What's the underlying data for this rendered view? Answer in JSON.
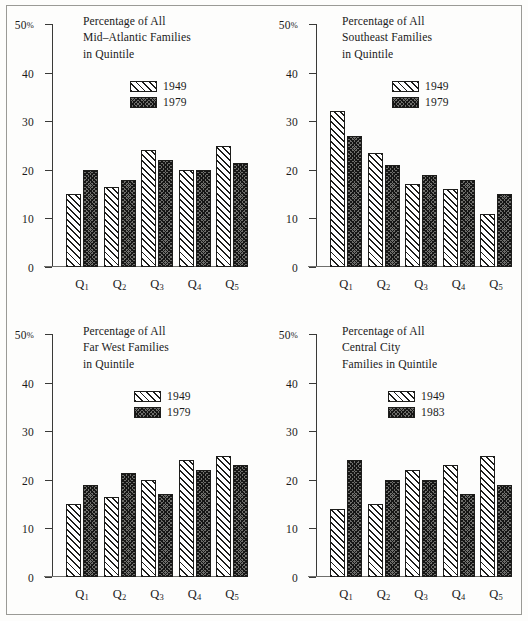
{
  "figure": {
    "axis": {
      "y_ticks": [
        {
          "value": 50,
          "label": "50",
          "suffix": "%"
        },
        {
          "value": 40,
          "label": "40",
          "suffix": ""
        },
        {
          "value": 30,
          "label": "30",
          "suffix": ""
        },
        {
          "value": 20,
          "label": "20",
          "suffix": ""
        },
        {
          "value": 10,
          "label": "10",
          "suffix": ""
        },
        {
          "value": 0,
          "label": "0",
          "suffix": ""
        }
      ],
      "y_min": 0,
      "y_max": 50
    }
  },
  "chart_data": [
    {
      "id": "mid-atlantic",
      "type": "bar",
      "title": "Percentage of All\nMid–Atlantic Families\nin Quintile",
      "xlabel": "",
      "ylabel": "",
      "ylim": [
        0,
        50
      ],
      "grid": false,
      "legend_position": "top-right",
      "categories": [
        "Q1",
        "Q2",
        "Q3",
        "Q4",
        "Q5"
      ],
      "category_labels": [
        {
          "base": "Q",
          "sub": "1"
        },
        {
          "base": "Q",
          "sub": "2"
        },
        {
          "base": "Q",
          "sub": "3"
        },
        {
          "base": "Q",
          "sub": "4"
        },
        {
          "base": "Q",
          "sub": "5"
        }
      ],
      "series": [
        {
          "name": "1949",
          "style": "hatch",
          "values": [
            15,
            16.5,
            24,
            20,
            25
          ]
        },
        {
          "name": "1979",
          "style": "crosshatch",
          "values": [
            20,
            18,
            22,
            20,
            21.5
          ]
        }
      ]
    },
    {
      "id": "southeast",
      "type": "bar",
      "title": "Percentage of All\nSoutheast Families\nin Quintile",
      "xlabel": "",
      "ylabel": "",
      "ylim": [
        0,
        50
      ],
      "grid": false,
      "legend_position": "top-right",
      "categories": [
        "Q1",
        "Q2",
        "Q3",
        "Q4",
        "Q5"
      ],
      "category_labels": [
        {
          "base": "Q",
          "sub": "1"
        },
        {
          "base": "Q",
          "sub": "2"
        },
        {
          "base": "Q",
          "sub": "3"
        },
        {
          "base": "Q",
          "sub": "4"
        },
        {
          "base": "Q",
          "sub": "5"
        }
      ],
      "series": [
        {
          "name": "1949",
          "style": "hatch",
          "values": [
            32,
            23.5,
            17,
            16,
            11
          ]
        },
        {
          "name": "1979",
          "style": "crosshatch",
          "values": [
            27,
            21,
            19,
            18,
            15
          ]
        }
      ]
    },
    {
      "id": "far-west",
      "type": "bar",
      "title": "Percentage of All\nFar West Families\nin Quintile",
      "xlabel": "",
      "ylabel": "",
      "ylim": [
        0,
        50
      ],
      "grid": false,
      "legend_position": "top-right",
      "categories": [
        "Q1",
        "Q2",
        "Q3",
        "Q4",
        "Q5"
      ],
      "category_labels": [
        {
          "base": "Q",
          "sub": "1"
        },
        {
          "base": "Q",
          "sub": "2"
        },
        {
          "base": "Q",
          "sub": "3"
        },
        {
          "base": "Q",
          "sub": "4"
        },
        {
          "base": "Q",
          "sub": "5"
        }
      ],
      "series": [
        {
          "name": "1949",
          "style": "hatch",
          "values": [
            15,
            16.5,
            20,
            24,
            25
          ]
        },
        {
          "name": "1979",
          "style": "crosshatch",
          "values": [
            19,
            21.5,
            17,
            22,
            23
          ]
        }
      ]
    },
    {
      "id": "central-city",
      "type": "bar",
      "title": "Percentage of All\nCentral City\nFamilies in Quintile",
      "xlabel": "",
      "ylabel": "",
      "ylim": [
        0,
        50
      ],
      "grid": false,
      "legend_position": "top-right",
      "categories": [
        "Q1",
        "Q2",
        "Q3",
        "Q4",
        "Q5"
      ],
      "category_labels": [
        {
          "base": "Q",
          "sub": "1"
        },
        {
          "base": "Q",
          "sub": "2"
        },
        {
          "base": "Q",
          "sub": "3"
        },
        {
          "base": "Q",
          "sub": "4"
        },
        {
          "base": "Q",
          "sub": "5"
        }
      ],
      "series": [
        {
          "name": "1949",
          "style": "hatch",
          "values": [
            14,
            15,
            22,
            23,
            25
          ]
        },
        {
          "name": "1983",
          "style": "crosshatch",
          "values": [
            24,
            20,
            20,
            17,
            19
          ]
        }
      ]
    }
  ],
  "colors": {
    "ink": "#1d1d1b",
    "axis": "#3a3a38",
    "frame": "#9a9a96",
    "series_a_fill": "#ffffff",
    "series_b_fill": "#6e6e6b",
    "background": "#fdfdfc"
  }
}
